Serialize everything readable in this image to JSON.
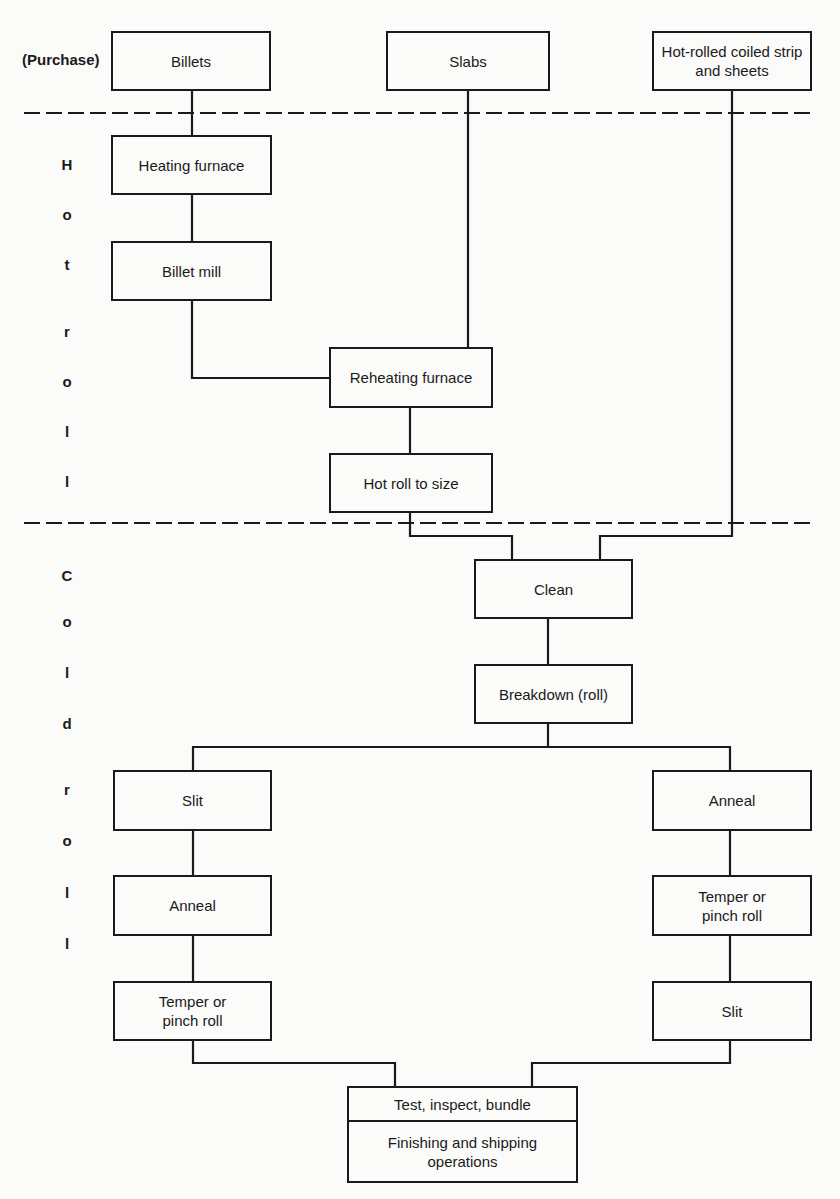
{
  "purchase_label": "(Purchase)",
  "sources": {
    "billets": "Billets",
    "slabs": "Slabs",
    "hot_rolled": "Hot-rolled coiled strip and sheets"
  },
  "sections": {
    "hot_roll": [
      "H",
      "o",
      "t",
      "r",
      "o",
      "l",
      "l"
    ],
    "cold_roll": [
      "C",
      "o",
      "l",
      "d",
      "r",
      "o",
      "l",
      "l"
    ]
  },
  "hot_roll_steps": {
    "heating_furnace": "Heating furnace",
    "billet_mill": "Billet mill",
    "reheating_furnace": "Reheating furnace",
    "hot_roll_to_size": "Hot roll to size"
  },
  "cold_roll_steps": {
    "clean": "Clean",
    "breakdown": "Breakdown (roll)",
    "left_branch": [
      "Slit",
      "Anneal",
      "Temper or pinch roll"
    ],
    "right_branch": [
      "Anneal",
      "Temper or pinch roll",
      "Slit"
    ]
  },
  "final": {
    "test": "Test, inspect, bundle",
    "finishing": "Finishing and shipping operations"
  }
}
